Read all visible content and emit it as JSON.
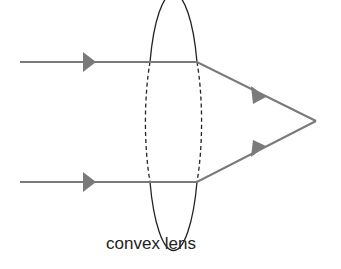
{
  "diagram": {
    "label": "convex lens",
    "colors": {
      "ray": "#7a7a7a",
      "lens": "#222222",
      "background": "#ffffff"
    },
    "lens": {
      "cx": 173,
      "cy": 121,
      "rx": 25,
      "ry": 104
    },
    "rays": [
      {
        "name": "top-ray",
        "start": [
          20,
          62
        ],
        "lens_exit": [
          197,
          62
        ],
        "focus": [
          316,
          121
        ]
      },
      {
        "name": "bottom-ray",
        "start": [
          20,
          182
        ],
        "lens_exit": [
          197,
          182
        ],
        "focus": [
          316,
          121
        ]
      }
    ],
    "focal_point": [
      316,
      121
    ]
  }
}
